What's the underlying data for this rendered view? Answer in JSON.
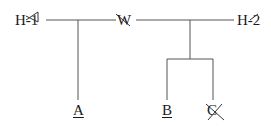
{
  "diagram": {
    "type": "tree",
    "nodes": {
      "h1": {
        "label": "H-1",
        "struck": true
      },
      "w": {
        "label": "W",
        "struck": true
      },
      "h2": {
        "label": "H-2",
        "struck": true
      },
      "a": {
        "label": "A",
        "underlined": true
      },
      "b": {
        "label": "B",
        "underlined": true
      },
      "c": {
        "label": "C",
        "struck": true
      }
    },
    "edges": [
      [
        "h1",
        "w"
      ],
      [
        "w",
        "h2"
      ],
      [
        "h1-w",
        "a"
      ],
      [
        "w-h2",
        "b"
      ],
      [
        "w-h2",
        "c"
      ]
    ],
    "line_color": "#555555"
  }
}
